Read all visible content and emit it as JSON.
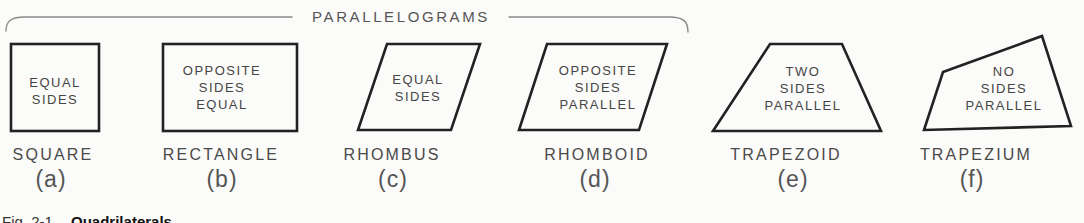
{
  "diagram": {
    "brace_label": "PARALLELOGRAMS",
    "caption": {
      "prefix": "Fig. 2-1.",
      "title": "Quadrilaterals"
    },
    "colors": {
      "background": "#fbfbf9",
      "shape_outline": "#222222",
      "text": "#454545",
      "brace": "#8a8a8a"
    },
    "shapes": [
      {
        "id": "square",
        "name": "SQUARE",
        "letter": "(a)",
        "property": "EQUAL\nSIDES"
      },
      {
        "id": "rectangle",
        "name": "RECTANGLE",
        "letter": "(b)",
        "property": "OPPOSITE\nSIDES\nEQUAL"
      },
      {
        "id": "rhombus",
        "name": "RHOMBUS",
        "letter": "(c)",
        "property": "EQUAL\nSIDES"
      },
      {
        "id": "rhomboid",
        "name": "RHOMBOID",
        "letter": "(d)",
        "property": "OPPOSITE\nSIDES\nPARALLEL"
      },
      {
        "id": "trapezoid",
        "name": "TRAPEZOID",
        "letter": "(e)",
        "property": "TWO\nSIDES\nPARALLEL"
      },
      {
        "id": "trapezium",
        "name": "TRAPEZIUM",
        "letter": "(f)",
        "property": "NO\nSIDES\nPARALLEL"
      }
    ]
  }
}
